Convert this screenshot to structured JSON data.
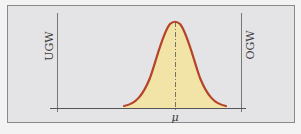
{
  "diagram": {
    "type": "normal-distribution-tolerance",
    "labels": {
      "lower_limit": "UGW",
      "upper_limit": "OGW",
      "mean": "μ"
    },
    "colors": {
      "background": "#e4e4e6",
      "frame_border": "#8a8a8a",
      "axis": "#555555",
      "limit_lines": "#777777",
      "curve_stroke": "#b5432a",
      "curve_fill": "#f2e3a6",
      "mean_line": "#555555"
    }
  }
}
